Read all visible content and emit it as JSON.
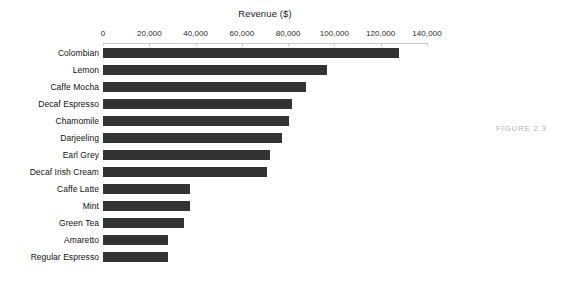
{
  "figure": {
    "caption": "FIGURE 2.3"
  },
  "chart_data": {
    "type": "bar",
    "orientation": "horizontal",
    "title": "Revenue ($)",
    "xlabel": "",
    "ylabel": "",
    "categories": [
      "Colombian",
      "Lemon",
      "Caffe Mocha",
      "Decaf Espresso",
      "Chamomile",
      "Darjeeling",
      "Earl Grey",
      "Decaf Irish Cream",
      "Caffe Latte",
      "Mint",
      "Green Tea",
      "Amaretto",
      "Regular Espresso"
    ],
    "values": [
      128000,
      97000,
      87600,
      81700,
      80400,
      77400,
      72300,
      71000,
      37800,
      37800,
      34900,
      28000,
      28000
    ],
    "xlim": [
      0,
      140000
    ],
    "xticks": [
      0,
      20000,
      40000,
      60000,
      80000,
      100000,
      120000,
      140000
    ],
    "xticklabels": [
      "0",
      "20,000",
      "40,000",
      "60,000",
      "80,000",
      "100,000",
      "120,000",
      "140,000"
    ],
    "grid": false,
    "legend": false,
    "bar_color": "#333333",
    "axis_color": "#c8c8c8",
    "background_color": "#ffffff"
  }
}
